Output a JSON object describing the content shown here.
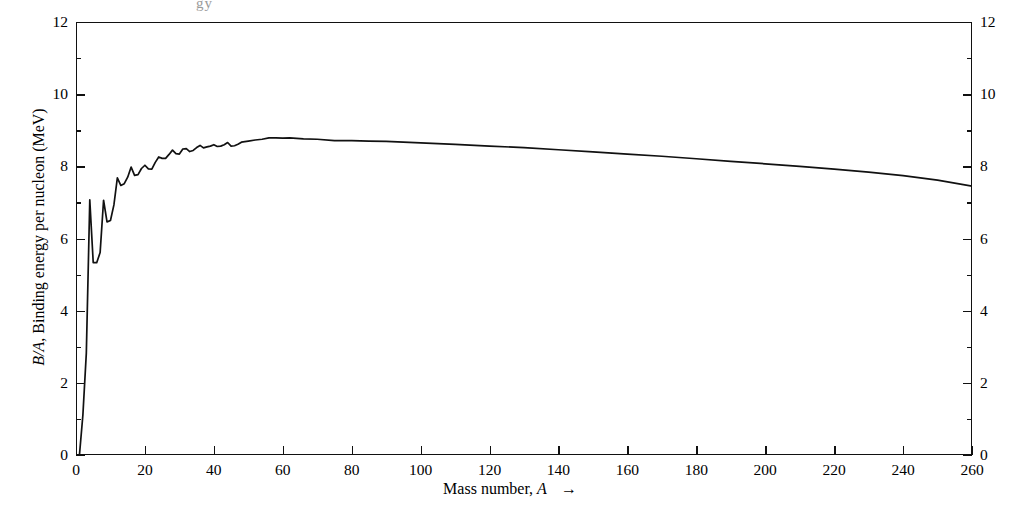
{
  "figure": {
    "name": "binding-energy-per-nucleon-curve",
    "top_artifact": "gy"
  },
  "axes": {
    "x": {
      "label_text": "Mass number, ",
      "label_italic": "A",
      "label_arrow": "→",
      "min": 0,
      "max": 260,
      "major_step": 20,
      "ticks": [
        0,
        20,
        40,
        60,
        80,
        100,
        120,
        140,
        160,
        180,
        200,
        220,
        240,
        260
      ]
    },
    "y": {
      "label_italic": "B/A",
      "label_text": ", Binding energy per nucleon (MeV)",
      "min": 0,
      "max": 12,
      "major_step": 2,
      "minor_step": 1,
      "ticks": [
        0,
        2,
        4,
        6,
        8,
        10,
        12
      ],
      "minor_ticks": [
        1,
        3,
        5,
        7,
        9,
        11
      ],
      "mirrored_right": true
    }
  },
  "chart_data": {
    "type": "line",
    "title": "",
    "xlabel": "Mass number, A",
    "ylabel": "B/A, Binding energy per nucleon (MeV)",
    "xlim": [
      0,
      260
    ],
    "ylim": [
      0,
      12
    ],
    "grid": false,
    "legend": "none",
    "line_color": "#111111",
    "x": [
      1,
      2,
      3,
      4,
      5,
      6,
      7,
      8,
      9,
      10,
      11,
      12,
      13,
      14,
      15,
      16,
      17,
      18,
      19,
      20,
      21,
      22,
      23,
      24,
      25,
      26,
      27,
      28,
      29,
      30,
      31,
      32,
      33,
      34,
      35,
      36,
      37,
      38,
      39,
      40,
      41,
      42,
      43,
      44,
      45,
      46,
      47,
      48,
      50,
      52,
      54,
      56,
      58,
      60,
      62,
      66,
      70,
      75,
      80,
      85,
      90,
      100,
      110,
      120,
      130,
      140,
      150,
      160,
      170,
      180,
      190,
      200,
      210,
      220,
      230,
      240,
      250,
      260
    ],
    "y": [
      0.0,
      1.11,
      2.83,
      7.07,
      5.33,
      5.33,
      5.61,
      7.06,
      6.46,
      6.5,
      6.93,
      7.68,
      7.47,
      7.52,
      7.7,
      7.98,
      7.75,
      7.77,
      7.94,
      8.03,
      7.93,
      7.92,
      8.11,
      8.26,
      8.22,
      8.22,
      8.33,
      8.45,
      8.35,
      8.34,
      8.48,
      8.49,
      8.41,
      8.44,
      8.52,
      8.58,
      8.51,
      8.54,
      8.56,
      8.6,
      8.55,
      8.56,
      8.6,
      8.66,
      8.56,
      8.57,
      8.61,
      8.67,
      8.7,
      8.73,
      8.75,
      8.79,
      8.79,
      8.78,
      8.79,
      8.76,
      8.75,
      8.71,
      8.71,
      8.7,
      8.69,
      8.65,
      8.61,
      8.56,
      8.52,
      8.46,
      8.4,
      8.34,
      8.28,
      8.21,
      8.14,
      8.07,
      8.0,
      7.92,
      7.84,
      7.74,
      7.62,
      7.45
    ],
    "annotations": [
      {
        "label": "He-4 peak",
        "x": 4,
        "y": 7.07
      },
      {
        "label": "Li-6 minimum",
        "x": 6,
        "y": 5.33
      },
      {
        "label": "Fe/Ni plateau maximum",
        "x": 56,
        "y": 8.79
      }
    ]
  }
}
